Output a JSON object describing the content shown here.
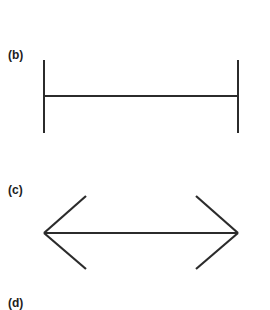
{
  "figure": {
    "background_color": "#ffffff",
    "stroke_color": "#2b2b2b",
    "panels": [
      {
        "label": "(b)",
        "description": "horizontal line with perpendicular end bars",
        "shaft": {
          "x1": 44,
          "y1": 96,
          "x2": 238,
          "y2": 96
        },
        "end_bars": [
          {
            "x1": 44,
            "y1": 60,
            "x2": 44,
            "y2": 133
          },
          {
            "x1": 238,
            "y1": 60,
            "x2": 238,
            "y2": 133
          }
        ]
      },
      {
        "label": "(c)",
        "description": "horizontal line with outward pointing arrowheads",
        "shaft": {
          "x1": 44,
          "y1": 233,
          "x2": 238,
          "y2": 233
        },
        "fins": [
          {
            "x1": 86,
            "y1": 196,
            "x2": 44,
            "y2": 233
          },
          {
            "x1": 86,
            "y1": 269,
            "x2": 44,
            "y2": 233
          },
          {
            "x1": 196,
            "y1": 196,
            "x2": 238,
            "y2": 233
          },
          {
            "x1": 196,
            "y1": 269,
            "x2": 238,
            "y2": 233
          }
        ]
      },
      {
        "label": "(d)",
        "description": "panel label only, figure clipped below image edge",
        "shaft": null,
        "fins": []
      }
    ]
  },
  "labels": {
    "b": "(b)",
    "c": "(c)",
    "d": "(d)"
  }
}
